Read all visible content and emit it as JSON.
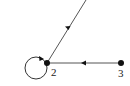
{
  "diagram": {
    "type": "directed-graph",
    "colors": {
      "edge": "#555555",
      "node": "#111111",
      "background": "#ffffff"
    },
    "nodes": [
      {
        "id": "2",
        "label": "2"
      },
      {
        "id": "3",
        "label": "3"
      }
    ],
    "edges": [
      {
        "from": "offscreen-top",
        "to": "2",
        "directed": true
      },
      {
        "from": "3",
        "to": "2",
        "directed": true
      },
      {
        "from": "2",
        "to": "2",
        "directed": true,
        "self_loop": true
      }
    ]
  }
}
